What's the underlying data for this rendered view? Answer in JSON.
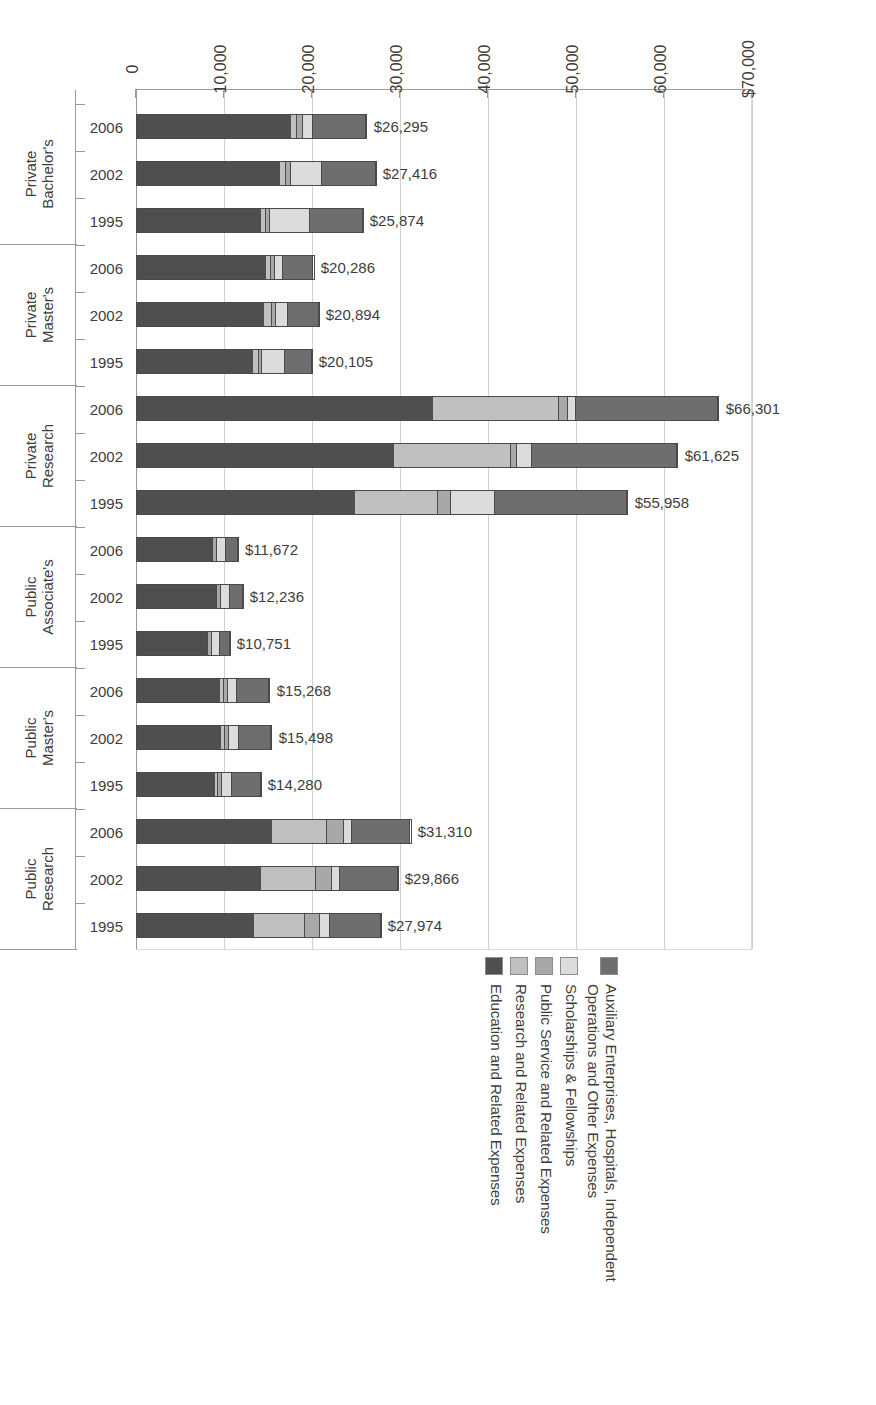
{
  "chart_data": {
    "type": "bar",
    "orientation": "horizontal-stacked",
    "title": "",
    "xlabel": "",
    "ylabel": "",
    "xlim": [
      0,
      70000
    ],
    "grid": true,
    "legend_position": "top",
    "axis_ticks": [
      "$70,000",
      "60,000",
      "50,000",
      "40,000",
      "30,000",
      "20,000",
      "10,000",
      "0"
    ],
    "axis_tick_values": [
      70000,
      60000,
      50000,
      40000,
      30000,
      20000,
      10000,
      0
    ],
    "series": [
      {
        "name": "Education and Related Expenses",
        "color": "#4f4f4f"
      },
      {
        "name": "Research and Related Expenses",
        "color": "#c0c0c0"
      },
      {
        "name": "Public Service and Related Expenses",
        "color": "#a8a8a8"
      },
      {
        "name": "Scholarships & Fellowships",
        "color": "#dcdcdc"
      },
      {
        "name": "Auxiliary Enterprises, Hospitals, Independent\nOperations and Other Expenses",
        "color": "#6e6e6e"
      }
    ],
    "legend_entries": [
      {
        "label": "Auxiliary Enterprises, Hospitals, Independent\nOperations and Other Expenses",
        "color": "#6e6e6e"
      },
      {
        "label": "Scholarships & Fellowships",
        "color": "#dcdcdc"
      },
      {
        "label": "Public Service and Related Expenses",
        "color": "#a8a8a8"
      },
      {
        "label": "Research and Related Expenses",
        "color": "#c0c0c0"
      },
      {
        "label": "Education and Related Expenses",
        "color": "#4f4f4f"
      }
    ],
    "groups": [
      {
        "name": "Public Research",
        "bars": [
          {
            "year": "1995",
            "total": 27974,
            "total_label": "$27,974",
            "segments": [
              {
                "series": "Education and Related Expenses",
                "value": 13400
              },
              {
                "series": "Research and Related Expenses",
                "value": 5900
              },
              {
                "series": "Public Service and Related Expenses",
                "value": 1700
              },
              {
                "series": "Scholarships & Fellowships",
                "value": 1100
              },
              {
                "series": "Auxiliary Enterprises, Hospitals, Independent Operations and Other Expenses",
                "value": 5874
              }
            ]
          },
          {
            "year": "2002",
            "total": 29866,
            "total_label": "$29,866",
            "segments": [
              {
                "series": "Education and Related Expenses",
                "value": 14200
              },
              {
                "series": "Research and Related Expenses",
                "value": 6300
              },
              {
                "series": "Public Service and Related Expenses",
                "value": 1800
              },
              {
                "series": "Scholarships & Fellowships",
                "value": 900
              },
              {
                "series": "Auxiliary Enterprises, Hospitals, Independent Operations and Other Expenses",
                "value": 6666
              }
            ]
          },
          {
            "year": "2006",
            "total": 31310,
            "total_label": "$31,310",
            "segments": [
              {
                "series": "Education and Related Expenses",
                "value": 15400
              },
              {
                "series": "Research and Related Expenses",
                "value": 6400
              },
              {
                "series": "Public Service and Related Expenses",
                "value": 1900
              },
              {
                "series": "Scholarships & Fellowships",
                "value": 900
              },
              {
                "series": "Auxiliary Enterprises, Hospitals, Independent Operations and Other Expenses",
                "value": 6710
              }
            ]
          }
        ]
      },
      {
        "name": "Public Master's",
        "bars": [
          {
            "year": "1995",
            "total": 14280,
            "total_label": "$14,280",
            "segments": [
              {
                "series": "Education and Related Expenses",
                "value": 9000
              },
              {
                "series": "Research and Related Expenses",
                "value": 400
              },
              {
                "series": "Public Service and Related Expenses",
                "value": 450
              },
              {
                "series": "Scholarships & Fellowships",
                "value": 1100
              },
              {
                "series": "Auxiliary Enterprises, Hospitals, Independent Operations and Other Expenses",
                "value": 3330
              }
            ]
          },
          {
            "year": "2002",
            "total": 15498,
            "total_label": "$15,498",
            "segments": [
              {
                "series": "Education and Related Expenses",
                "value": 9700
              },
              {
                "series": "Research and Related Expenses",
                "value": 450
              },
              {
                "series": "Public Service and Related Expenses",
                "value": 500
              },
              {
                "series": "Scholarships & Fellowships",
                "value": 1150
              },
              {
                "series": "Auxiliary Enterprises, Hospitals, Independent Operations and Other Expenses",
                "value": 3698
              }
            ]
          },
          {
            "year": "2006",
            "total": 15268,
            "total_label": "$15,268",
            "segments": [
              {
                "series": "Education and Related Expenses",
                "value": 9600
              },
              {
                "series": "Research and Related Expenses",
                "value": 430
              },
              {
                "series": "Public Service and Related Expenses",
                "value": 480
              },
              {
                "series": "Scholarships & Fellowships",
                "value": 1050
              },
              {
                "series": "Auxiliary Enterprises, Hospitals, Independent Operations and Other Expenses",
                "value": 3708
              }
            ]
          }
        ]
      },
      {
        "name": "Public Associate's",
        "bars": [
          {
            "year": "1995",
            "total": 10751,
            "total_label": "$10,751",
            "segments": [
              {
                "series": "Education and Related Expenses",
                "value": 8100
              },
              {
                "series": "Research and Related Expenses",
                "value": 120
              },
              {
                "series": "Public Service and Related Expenses",
                "value": 480
              },
              {
                "series": "Scholarships & Fellowships",
                "value": 900
              },
              {
                "series": "Auxiliary Enterprises, Hospitals, Independent Operations and Other Expenses",
                "value": 1151
              }
            ]
          },
          {
            "year": "2002",
            "total": 12236,
            "total_label": "$12,236",
            "segments": [
              {
                "series": "Education and Related Expenses",
                "value": 9100
              },
              {
                "series": "Research and Related Expenses",
                "value": 130
              },
              {
                "series": "Public Service and Related Expenses",
                "value": 520
              },
              {
                "series": "Scholarships & Fellowships",
                "value": 1000
              },
              {
                "series": "Auxiliary Enterprises, Hospitals, Independent Operations and Other Expenses",
                "value": 1486
              }
            ]
          },
          {
            "year": "2006",
            "total": 11672,
            "total_label": "$11,672",
            "segments": [
              {
                "series": "Education and Related Expenses",
                "value": 8700
              },
              {
                "series": "Research and Related Expenses",
                "value": 120
              },
              {
                "series": "Public Service and Related Expenses",
                "value": 500
              },
              {
                "series": "Scholarships & Fellowships",
                "value": 950
              },
              {
                "series": "Auxiliary Enterprises, Hospitals, Independent Operations and Other Expenses",
                "value": 1402
              }
            ]
          }
        ]
      },
      {
        "name": "Private Research",
        "bars": [
          {
            "year": "1995",
            "total": 55958,
            "total_label": "$55,958",
            "segments": [
              {
                "series": "Education and Related Expenses",
                "value": 24900
              },
              {
                "series": "Research and Related Expenses",
                "value": 9400
              },
              {
                "series": "Public Service and Related Expenses",
                "value": 1500
              },
              {
                "series": "Scholarships & Fellowships",
                "value": 5000
              },
              {
                "series": "Auxiliary Enterprises, Hospitals, Independent Operations and Other Expenses",
                "value": 15158
              }
            ]
          },
          {
            "year": "2002",
            "total": 61625,
            "total_label": "$61,625",
            "segments": [
              {
                "series": "Education and Related Expenses",
                "value": 29300
              },
              {
                "series": "Research and Related Expenses",
                "value": 13400
              },
              {
                "series": "Public Service and Related Expenses",
                "value": 700
              },
              {
                "series": "Scholarships & Fellowships",
                "value": 1700
              },
              {
                "series": "Auxiliary Enterprises, Hospitals, Independent Operations and Other Expenses",
                "value": 16525
              }
            ]
          },
          {
            "year": "2006",
            "total": 66301,
            "total_label": "$66,301",
            "segments": [
              {
                "series": "Education and Related Expenses",
                "value": 33700
              },
              {
                "series": "Research and Related Expenses",
                "value": 14400
              },
              {
                "series": "Public Service and Related Expenses",
                "value": 1100
              },
              {
                "series": "Scholarships & Fellowships",
                "value": 900
              },
              {
                "series": "Auxiliary Enterprises, Hospitals, Independent Operations and Other Expenses",
                "value": 16201
              }
            ]
          }
        ]
      },
      {
        "name": "Private Master's",
        "bars": [
          {
            "year": "1995",
            "total": 20105,
            "total_label": "$20,105",
            "segments": [
              {
                "series": "Education and Related Expenses",
                "value": 13300
              },
              {
                "series": "Research and Related Expenses",
                "value": 700
              },
              {
                "series": "Public Service and Related Expenses",
                "value": 400
              },
              {
                "series": "Scholarships & Fellowships",
                "value": 2600
              },
              {
                "series": "Auxiliary Enterprises, Hospitals, Independent Operations and Other Expenses",
                "value": 3105
              }
            ]
          },
          {
            "year": "2002",
            "total": 20894,
            "total_label": "$20,894",
            "segments": [
              {
                "series": "Education and Related Expenses",
                "value": 14600
              },
              {
                "series": "Research and Related Expenses",
                "value": 900
              },
              {
                "series": "Public Service and Related Expenses",
                "value": 500
              },
              {
                "series": "Scholarships & Fellowships",
                "value": 1400
              },
              {
                "series": "Auxiliary Enterprises, Hospitals, Independent Operations and Other Expenses",
                "value": 3494
              }
            ]
          },
          {
            "year": "2006",
            "total": 20286,
            "total_label": "$20,286",
            "segments": [
              {
                "series": "Education and Related Expenses",
                "value": 14800
              },
              {
                "series": "Research and Related Expenses",
                "value": 600
              },
              {
                "series": "Public Service and Related Expenses",
                "value": 450
              },
              {
                "series": "Scholarships & Fellowships",
                "value": 900
              },
              {
                "series": "Auxiliary Enterprises, Hospitals, Independent Operations and Other Expenses",
                "value": 3536
              }
            ]
          }
        ]
      },
      {
        "name": "Private Bachelor's",
        "bars": [
          {
            "year": "1995",
            "total": 25874,
            "total_label": "$25,874",
            "segments": [
              {
                "series": "Education and Related Expenses",
                "value": 14200
              },
              {
                "series": "Research and Related Expenses",
                "value": 600
              },
              {
                "series": "Public Service and Related Expenses",
                "value": 500
              },
              {
                "series": "Scholarships & Fellowships",
                "value": 4500
              },
              {
                "series": "Auxiliary Enterprises, Hospitals, Independent Operations and Other Expenses",
                "value": 6074
              }
            ]
          },
          {
            "year": "2002",
            "total": 27416,
            "total_label": "$27,416",
            "segments": [
              {
                "series": "Education and Related Expenses",
                "value": 16400
              },
              {
                "series": "Research and Related Expenses",
                "value": 700
              },
              {
                "series": "Public Service and Related Expenses",
                "value": 600
              },
              {
                "series": "Scholarships & Fellowships",
                "value": 3500
              },
              {
                "series": "Auxiliary Enterprises, Hospitals, Independent Operations and Other Expenses",
                "value": 6216
              }
            ]
          },
          {
            "year": "2006",
            "total": 26295,
            "total_label": "$26,295",
            "segments": [
              {
                "series": "Education and Related Expenses",
                "value": 17700
              },
              {
                "series": "Research and Related Expenses",
                "value": 700
              },
              {
                "series": "Public Service and Related Expenses",
                "value": 600
              },
              {
                "series": "Scholarships & Fellowships",
                "value": 1200
              },
              {
                "series": "Auxiliary Enterprises, Hospitals, Independent Operations and Other Expenses",
                "value": 6095
              }
            ]
          }
        ]
      }
    ]
  }
}
